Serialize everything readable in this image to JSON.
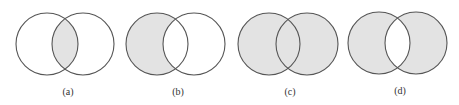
{
  "figure": {
    "colors": {
      "outline": "#555555",
      "shade": "#e3e3e3",
      "background": "#ffffff",
      "label": "#333333"
    },
    "panels": [
      {
        "label": "(a)",
        "shaded_region": "intersection",
        "left_circle": {
          "cx": 47,
          "cy": 44,
          "r": 31
        },
        "right_circle": {
          "cx": 83,
          "cy": 44,
          "r": 31
        },
        "label_pos": {
          "x": 68,
          "y": 95
        }
      },
      {
        "label": "(b)",
        "shaded_region": "left-only",
        "left_circle": {
          "cx": 157,
          "cy": 44,
          "r": 31
        },
        "right_circle": {
          "cx": 194,
          "cy": 44,
          "r": 31
        },
        "label_pos": {
          "x": 178,
          "y": 95
        }
      },
      {
        "label": "(c)",
        "shaded_region": "union",
        "left_circle": {
          "cx": 269,
          "cy": 44,
          "r": 31
        },
        "right_circle": {
          "cx": 307,
          "cy": 44,
          "r": 31
        },
        "label_pos": {
          "x": 290,
          "y": 95
        }
      },
      {
        "label": "(d)",
        "shaded_region": "symmetric-difference",
        "left_circle": {
          "cx": 379,
          "cy": 43,
          "r": 31
        },
        "right_circle": {
          "cx": 416,
          "cy": 43,
          "r": 31
        },
        "label_pos": {
          "x": 400,
          "y": 94
        }
      }
    ]
  }
}
